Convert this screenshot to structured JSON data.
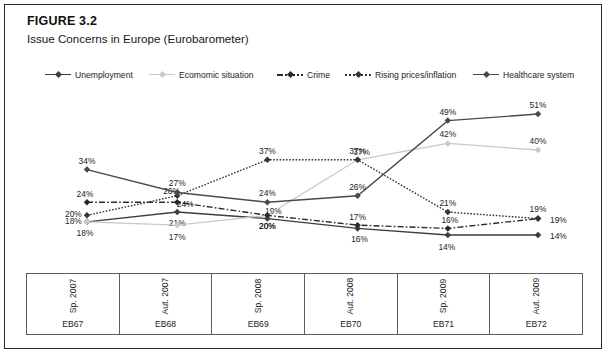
{
  "figure": {
    "number": "FIGURE 3.2",
    "caption": "Issue Concerns in Europe (Eurobarometer)"
  },
  "legend": [
    {
      "label": "Unemployment",
      "style": "solid",
      "color": "#3d3d3d",
      "marker": "diamond"
    },
    {
      "label": "Ecomomic situation",
      "style": "solid-light",
      "color": "#c9c9c9",
      "marker": "diamond"
    },
    {
      "label": "Crime",
      "style": "dashdot",
      "color": "#2a2a2a",
      "marker": "diamond"
    },
    {
      "label": "Rising prices/inflation",
      "style": "dotted",
      "color": "#343434",
      "marker": "diamond"
    },
    {
      "label": "Healthcare system",
      "style": "solid",
      "color": "#4a4a4a",
      "marker": "diamond"
    }
  ],
  "axis": {
    "periods": [
      "Sp. 2007",
      "Aut. 2007",
      "Sp. 2008",
      "Aut. 2008",
      "Sp. 2009",
      "Aut. 2009"
    ],
    "codes": [
      "EB67",
      "EB68",
      "EB69",
      "EB70",
      "EB71",
      "EB72"
    ]
  },
  "chart_data": {
    "type": "line",
    "title": "Issue Concerns in Europe (Eurobarometer)",
    "xlabel": "",
    "ylabel": "",
    "ylim": [
      10,
      55
    ],
    "grid": false,
    "legend_position": "top",
    "categories": [
      "Sp. 2007",
      "Aut. 2007",
      "Sp. 2008",
      "Aut. 2008",
      "Sp. 2009",
      "Aut. 2009"
    ],
    "category_codes": [
      "EB67",
      "EB68",
      "EB69",
      "EB70",
      "EB71",
      "EB72"
    ],
    "value_suffix": "%",
    "series": [
      {
        "name": "Unemployment",
        "values": [
          18,
          21,
          19,
          16,
          14,
          14
        ],
        "labels": [
          "18%",
          "21%",
          "19%",
          "16%",
          "14%",
          "14%"
        ]
      },
      {
        "name": "Ecomomic situation",
        "values": [
          18,
          17,
          20,
          37,
          42,
          40
        ],
        "labels": [
          "18%",
          "17%",
          "20%",
          "37%",
          "42%",
          "40%"
        ]
      },
      {
        "name": "Crime",
        "values": [
          24,
          24,
          20,
          17,
          16,
          19
        ],
        "labels": [
          "24%",
          "24%",
          "20%",
          "17%",
          "16%",
          "19%"
        ]
      },
      {
        "name": "Rising prices/inflation",
        "values": [
          20,
          26,
          37,
          37,
          21,
          19
        ],
        "labels": [
          "20%",
          "26%",
          "37%",
          "37%",
          "21%",
          "19%"
        ]
      },
      {
        "name": "Healthcare system",
        "values": [
          34,
          27,
          24,
          26,
          49,
          51
        ],
        "labels": [
          "34%",
          "27%",
          "24%",
          "26%",
          "49%",
          "51%"
        ]
      }
    ]
  }
}
